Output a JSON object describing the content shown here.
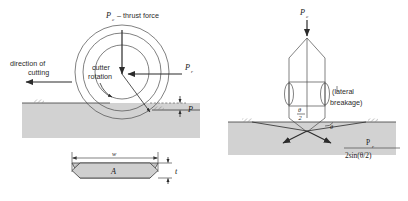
{
  "figure": {
    "title_hidden": "",
    "panels": [
      {
        "id": "left",
        "name": "disc-cutter-penetration",
        "labels": {
          "thrust": "P",
          "thrust_sub": "c",
          "thrust_text": "– thrust force",
          "direction": "direction of",
          "direction2": "cutting",
          "rotation": "cutter",
          "rotation2": "rotation",
          "rolling": "P",
          "rolling_sub": "r",
          "depth": "P",
          "width": "w",
          "area": "A",
          "thickness": "t"
        }
      },
      {
        "id": "right",
        "name": "indenter-lateral-breakage",
        "labels": {
          "thrust": "P",
          "thrust_sub": "c",
          "breakage1": "(lateral",
          "breakage2": "breakage)",
          "angle_half_num": "θ",
          "angle_half_den": "2",
          "angle": "θ",
          "force_num": "P",
          "force_num_sub": "r",
          "force_den": "2sin(θ/2)"
        }
      }
    ]
  },
  "colors": {
    "ground_fill": "#d2d2d2",
    "line": "#3a3a3a",
    "text": "#1a1a1a",
    "chip_fill": "#cfcfcf",
    "background": "#ffffff"
  }
}
